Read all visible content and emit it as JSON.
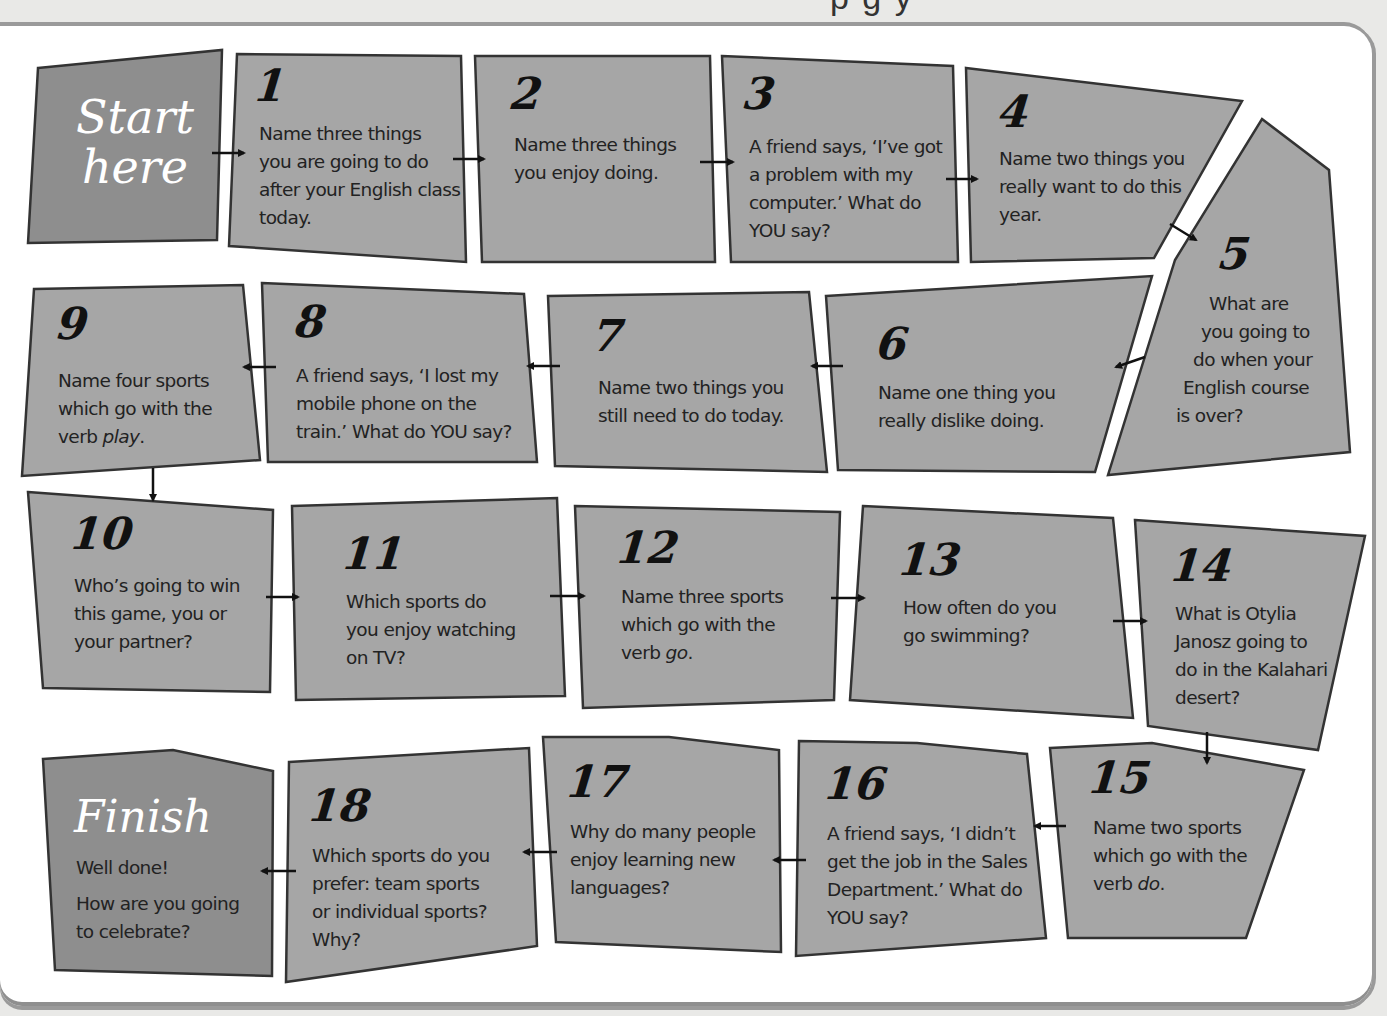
{
  "header": {
    "fragment": "p  g        y"
  },
  "colors": {
    "board": "#ffffff",
    "cell_fill": "#a6a6a6",
    "special_fill": "#8e8e8e",
    "outline": "#333333",
    "text": "#222222",
    "frame": "#9a9a9a",
    "background": "#e9e9e7"
  },
  "start": {
    "line1": "Start",
    "line2": "here"
  },
  "finish": {
    "title": "Finish",
    "line1": "Well done!",
    "line2": "How are you going",
    "line3": "to celebrate?"
  },
  "cells": [
    {
      "number": "1",
      "lines": [
        "Name three things",
        "you are going to do",
        "after your English class",
        "today."
      ]
    },
    {
      "number": "2",
      "lines": [
        "Name three things",
        "you enjoy doing."
      ]
    },
    {
      "number": "3",
      "lines": [
        "A friend says, ‘I’ve got",
        "a problem with my",
        "computer.’ What do",
        "YOU say?"
      ]
    },
    {
      "number": "4",
      "lines": [
        "Name two things you",
        "really want to do this",
        "year."
      ]
    },
    {
      "number": "5",
      "lines": [
        "What are",
        "you going to",
        "do when your",
        "English course",
        "is over?"
      ]
    },
    {
      "number": "6",
      "lines": [
        "Name one thing you",
        "really dislike doing."
      ]
    },
    {
      "number": "7",
      "lines": [
        "Name two things you",
        "still need to do today."
      ]
    },
    {
      "number": "8",
      "lines": [
        "A friend says, ‘I lost my",
        "mobile phone on the",
        "train.’ What do YOU say?"
      ]
    },
    {
      "number": "9",
      "lines": [
        "Name four sports",
        "which go with the",
        "verb ",
        "play",
        "."
      ]
    },
    {
      "number": "10",
      "lines": [
        "Who’s going to win",
        "this game, you or",
        "your partner?"
      ]
    },
    {
      "number": "11",
      "lines": [
        "Which sports do",
        "you enjoy watching",
        "on TV?"
      ]
    },
    {
      "number": "12",
      "lines": [
        "Name three sports",
        "which go with the",
        "verb ",
        "go",
        "."
      ]
    },
    {
      "number": "13",
      "lines": [
        "How often do you",
        "go swimming?"
      ]
    },
    {
      "number": "14",
      "lines": [
        "What is Otylia",
        "Janosz going to",
        "do in the Kalahari",
        "desert?"
      ]
    },
    {
      "number": "15",
      "lines": [
        "Name two sports",
        "which go with the",
        "verb ",
        "do",
        "."
      ]
    },
    {
      "number": "16",
      "lines": [
        "A friend says, ‘I didn’t",
        "get the job in the Sales",
        "Department.’ What do",
        "YOU say?"
      ]
    },
    {
      "number": "17",
      "lines": [
        "Why do many people",
        "enjoy learning new",
        "languages?"
      ]
    },
    {
      "number": "18",
      "lines": [
        "Which sports do you",
        "prefer: team sports",
        "or individual sports?",
        "Why?"
      ]
    }
  ]
}
